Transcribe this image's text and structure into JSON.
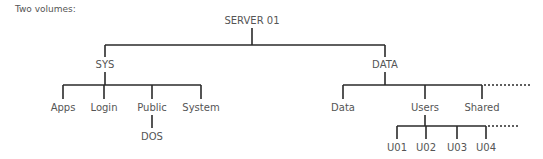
{
  "caption": "Two volumes:",
  "tree": {
    "root": "SERVER 01",
    "volumes": [
      {
        "name": "SYS",
        "children": [
          "Apps",
          "Login",
          "Public",
          "System"
        ],
        "sub": {
          "Public": [
            "DOS"
          ]
        }
      },
      {
        "name": "DATA",
        "children": [
          "Data",
          "Users",
          "Shared"
        ],
        "sub": {
          "Users": [
            "U01",
            "U02",
            "U03",
            "U04"
          ]
        }
      }
    ]
  },
  "labels": {
    "root": "SERVER 01",
    "sys": "SYS",
    "data_vol": "DATA",
    "apps": "Apps",
    "login": "Login",
    "public": "Public",
    "system": "System",
    "dos": "DOS",
    "data_dir": "Data",
    "users": "Users",
    "shared": "Shared",
    "u01": "U01",
    "u02": "U02",
    "u03": "U03",
    "u04": "U04"
  }
}
